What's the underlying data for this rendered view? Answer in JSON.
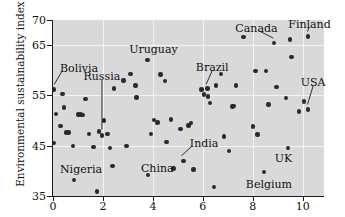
{
  "chart_data": {
    "type": "scatter",
    "title": "",
    "xlabel": "",
    "ylabel": "Environmental sustainability index",
    "xlim": [
      0,
      10.85
    ],
    "ylim": [
      35,
      70
    ],
    "grid": true,
    "legend": "none",
    "x_ticks": [
      0,
      2,
      4,
      6,
      8,
      10
    ],
    "y_ticks": [
      35,
      45,
      55,
      65,
      70
    ],
    "x_tick_labels": [
      "0",
      "2",
      "4",
      "6",
      "8",
      "10"
    ],
    "y_tick_labels": [
      "35",
      "45",
      "55",
      "65",
      "70"
    ],
    "gridlines_x": [
      2,
      4,
      6,
      8,
      10
    ],
    "gridlines_y": [
      45,
      55,
      65
    ],
    "point_color": "#2a2a2a",
    "plot_background": "#d9d9d9",
    "gridline_color": "#f4f4f4",
    "points": [
      {
        "x": 0.05,
        "y": 56.2
      },
      {
        "x": 0.05,
        "y": 45.6
      },
      {
        "x": 0.12,
        "y": 51.3
      },
      {
        "x": 0.3,
        "y": 48.9
      },
      {
        "x": 0.38,
        "y": 55.3
      },
      {
        "x": 0.45,
        "y": 52.6
      },
      {
        "x": 0.52,
        "y": 47.6
      },
      {
        "x": 0.62,
        "y": 47.6
      },
      {
        "x": 0.8,
        "y": 44.9
      },
      {
        "x": 0.85,
        "y": 38.2
      },
      {
        "x": 1.02,
        "y": 51.2
      },
      {
        "x": 1.12,
        "y": 51.2
      },
      {
        "x": 1.18,
        "y": 51.1
      },
      {
        "x": 1.3,
        "y": 54.3
      },
      {
        "x": 1.45,
        "y": 47.3
      },
      {
        "x": 1.62,
        "y": 44.8
      },
      {
        "x": 1.75,
        "y": 35.9
      },
      {
        "x": 1.85,
        "y": 47.8
      },
      {
        "x": 1.95,
        "y": 47.0
      },
      {
        "x": 2.05,
        "y": 50.0
      },
      {
        "x": 2.18,
        "y": 47.3
      },
      {
        "x": 2.28,
        "y": 44.6
      },
      {
        "x": 2.38,
        "y": 41.0
      },
      {
        "x": 2.45,
        "y": 56.4
      },
      {
        "x": 2.82,
        "y": 58.0
      },
      {
        "x": 2.95,
        "y": 45.0
      },
      {
        "x": 3.1,
        "y": 59.3
      },
      {
        "x": 3.3,
        "y": 57.0
      },
      {
        "x": 3.35,
        "y": 54.6
      },
      {
        "x": 3.78,
        "y": 62.1
      },
      {
        "x": 3.8,
        "y": 39.2
      },
      {
        "x": 3.92,
        "y": 47.3
      },
      {
        "x": 4.05,
        "y": 50.1
      },
      {
        "x": 4.18,
        "y": 49.6
      },
      {
        "x": 4.3,
        "y": 59.2
      },
      {
        "x": 4.48,
        "y": 57.9
      },
      {
        "x": 4.55,
        "y": 45.7
      },
      {
        "x": 4.72,
        "y": 50.2
      },
      {
        "x": 4.82,
        "y": 40.5
      },
      {
        "x": 5.1,
        "y": 48.3
      },
      {
        "x": 5.22,
        "y": 42.0
      },
      {
        "x": 5.42,
        "y": 49.0
      },
      {
        "x": 5.52,
        "y": 49.5
      },
      {
        "x": 5.62,
        "y": 40.3
      },
      {
        "x": 5.95,
        "y": 56.2
      },
      {
        "x": 6.05,
        "y": 55.2
      },
      {
        "x": 6.18,
        "y": 56.4
      },
      {
        "x": 6.2,
        "y": 54.8
      },
      {
        "x": 6.28,
        "y": 53.5
      },
      {
        "x": 6.45,
        "y": 36.8
      },
      {
        "x": 6.52,
        "y": 57.0
      },
      {
        "x": 6.72,
        "y": 59.3
      },
      {
        "x": 6.85,
        "y": 46.8
      },
      {
        "x": 7.05,
        "y": 44.0
      },
      {
        "x": 7.18,
        "y": 52.8
      },
      {
        "x": 7.25,
        "y": 52.9
      },
      {
        "x": 7.32,
        "y": 57.0
      },
      {
        "x": 7.62,
        "y": 66.6
      },
      {
        "x": 8.0,
        "y": 48.8
      },
      {
        "x": 8.1,
        "y": 59.8
      },
      {
        "x": 8.18,
        "y": 47.2
      },
      {
        "x": 8.45,
        "y": 39.8
      },
      {
        "x": 8.52,
        "y": 59.9
      },
      {
        "x": 8.62,
        "y": 53.2
      },
      {
        "x": 8.85,
        "y": 65.4
      },
      {
        "x": 8.95,
        "y": 56.7
      },
      {
        "x": 9.32,
        "y": 54.5
      },
      {
        "x": 9.42,
        "y": 44.5
      },
      {
        "x": 9.5,
        "y": 66.1
      },
      {
        "x": 9.55,
        "y": 62.6
      },
      {
        "x": 9.85,
        "y": 51.8
      },
      {
        "x": 10.05,
        "y": 53.8
      },
      {
        "x": 10.22,
        "y": 66.7
      },
      {
        "x": 10.22,
        "y": 52.2
      }
    ],
    "annotations": [
      {
        "label": "Bolivia",
        "label_x": 0.28,
        "label_y": 60.2,
        "target_x": 0.05,
        "target_y": 56.6,
        "leader": true
      },
      {
        "label": "Russia",
        "label_x": 1.22,
        "label_y": 58.6,
        "target_x": 1.96,
        "target_y": 47.6,
        "leader": true
      },
      {
        "label": "Nigeria",
        "label_x": 0.28,
        "label_y": 40.2,
        "target_x": null,
        "target_y": null,
        "leader": false
      },
      {
        "label": "Uruguay",
        "label_x": 3.05,
        "label_y": 64.1,
        "target_x": null,
        "target_y": null,
        "leader": false
      },
      {
        "label": "China",
        "label_x": 3.52,
        "label_y": 40.4,
        "target_x": null,
        "target_y": null,
        "leader": false
      },
      {
        "label": "Brazil",
        "label_x": 5.72,
        "label_y": 60.4,
        "target_x": 6.13,
        "target_y": 56.6,
        "leader": true
      },
      {
        "label": "India",
        "label_x": 5.48,
        "label_y": 45.3,
        "target_x": 5.14,
        "target_y": 42.4,
        "leader": true
      },
      {
        "label": "Canada",
        "label_x": 7.3,
        "label_y": 68.3,
        "target_x": 8.82,
        "target_y": 65.8,
        "leader": true
      },
      {
        "label": "Finland",
        "label_x": 9.42,
        "label_y": 69.0,
        "target_x": 10.19,
        "target_y": 67.1,
        "leader": true
      },
      {
        "label": "USA",
        "label_x": 9.92,
        "label_y": 57.4,
        "target_x": 10.19,
        "target_y": 52.6,
        "leader": true
      },
      {
        "label": "UK",
        "label_x": 8.88,
        "label_y": 42.4,
        "target_x": null,
        "target_y": null,
        "leader": false
      },
      {
        "label": "Belgium",
        "label_x": 7.72,
        "label_y": 37.2,
        "target_x": null,
        "target_y": null,
        "leader": false
      }
    ]
  }
}
